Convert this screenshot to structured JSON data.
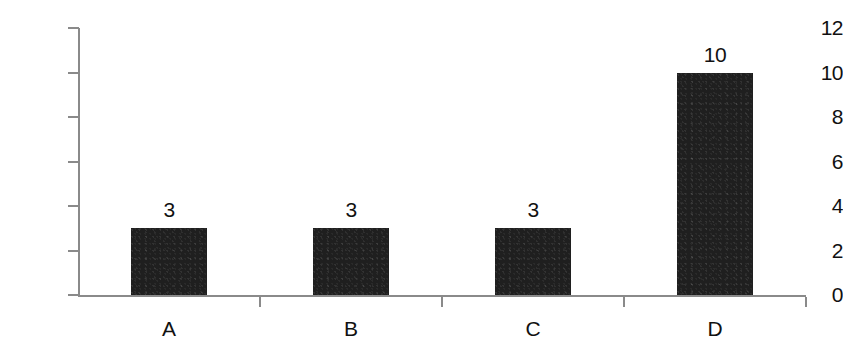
{
  "chart_data": {
    "type": "bar",
    "title": "",
    "subtitle": "",
    "xlabel": "",
    "ylabel": "",
    "categories": [
      "A",
      "B",
      "C",
      "D"
    ],
    "values": [
      3,
      3,
      3,
      10
    ],
    "data_labels": [
      "3",
      "3",
      "3",
      "10"
    ],
    "ylim": [
      0,
      12
    ],
    "y_ticks": [
      0,
      2,
      4,
      6,
      8,
      10,
      12
    ],
    "y_tick_labels": [
      "0",
      "2",
      "4",
      "6",
      "8",
      "10",
      "12"
    ],
    "grid": false,
    "legend": null,
    "bar_color": "#1f1f1f",
    "axis_color": "#8a8a8a",
    "background_color": "#ffffff"
  }
}
